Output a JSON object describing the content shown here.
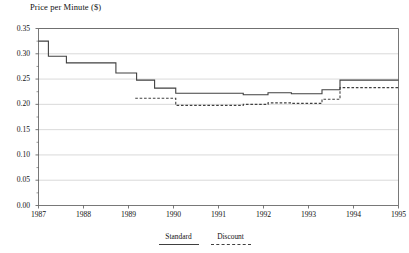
{
  "chart_data": {
    "type": "line",
    "title": "",
    "ylabel": "Price per Minute ($)",
    "xlabel": "",
    "ylim": [
      0.0,
      0.35
    ],
    "xlim": [
      1987.0,
      1995.0
    ],
    "grid": true,
    "legend_position": "bottom-center",
    "ytick_labels": [
      "0.35",
      "0.30",
      "0.25",
      "0.20",
      "0.15",
      "0.10",
      "0.05",
      "0.00"
    ],
    "ytick_values": [
      0.35,
      0.3,
      0.25,
      0.2,
      0.15,
      0.1,
      0.05,
      0.0
    ],
    "xtick_labels": [
      "1987",
      "1988",
      "1989",
      "1990",
      "1991",
      "1992",
      "1993",
      "1994",
      "1995"
    ],
    "xtick_values": [
      1987,
      1988,
      1989,
      1990,
      1991,
      1992,
      1993,
      1994,
      1995
    ],
    "line_color": "#404040",
    "grid_color": "#c9c9c9",
    "axis_color": "#555555",
    "series": [
      {
        "name": "Standard",
        "style": "solid",
        "step": "post",
        "points": [
          [
            1987.0,
            0.325
          ],
          [
            1987.22,
            0.325
          ],
          [
            1987.22,
            0.295
          ],
          [
            1987.62,
            0.295
          ],
          [
            1987.62,
            0.282
          ],
          [
            1988.72,
            0.282
          ],
          [
            1988.72,
            0.262
          ],
          [
            1989.18,
            0.262
          ],
          [
            1989.18,
            0.248
          ],
          [
            1989.58,
            0.248
          ],
          [
            1989.58,
            0.232
          ],
          [
            1990.05,
            0.232
          ],
          [
            1990.05,
            0.222
          ],
          [
            1991.55,
            0.222
          ],
          [
            1991.55,
            0.219
          ],
          [
            1992.1,
            0.219
          ],
          [
            1992.1,
            0.223
          ],
          [
            1992.62,
            0.223
          ],
          [
            1992.62,
            0.221
          ],
          [
            1993.3,
            0.221
          ],
          [
            1993.3,
            0.229
          ],
          [
            1993.7,
            0.229
          ],
          [
            1993.7,
            0.248
          ],
          [
            1995.0,
            0.248
          ]
        ]
      },
      {
        "name": "Discount",
        "style": "dashed",
        "step": "post",
        "points": [
          [
            1989.15,
            0.212
          ],
          [
            1990.05,
            0.212
          ],
          [
            1990.05,
            0.198
          ],
          [
            1991.55,
            0.198
          ],
          [
            1991.55,
            0.2
          ],
          [
            1992.1,
            0.2
          ],
          [
            1992.1,
            0.203
          ],
          [
            1992.62,
            0.203
          ],
          [
            1992.62,
            0.202
          ],
          [
            1993.3,
            0.202
          ],
          [
            1993.3,
            0.21
          ],
          [
            1993.7,
            0.21
          ],
          [
            1993.7,
            0.233
          ],
          [
            1995.0,
            0.233
          ]
        ]
      }
    ]
  },
  "legend": {
    "entries": [
      {
        "label": "Standard",
        "style": "solid"
      },
      {
        "label": "Discount",
        "style": "dashed"
      }
    ]
  }
}
